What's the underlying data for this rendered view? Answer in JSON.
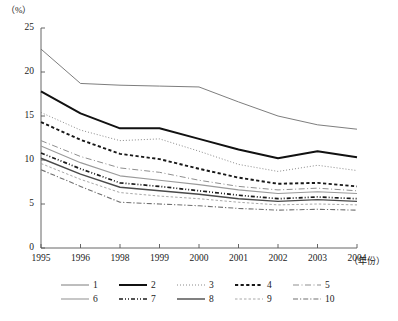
{
  "chart_data": {
    "type": "line",
    "title": "",
    "xlabel": "（年份）",
    "ylabel": "（%）",
    "x": [
      "1995",
      "1996",
      "1998",
      "1999",
      "2000",
      "2001",
      "2002",
      "2003",
      "2004"
    ],
    "categories": [
      "1995",
      "1996",
      "1998",
      "1999",
      "2000",
      "2001",
      "2002",
      "2003",
      "2004"
    ],
    "ylim": [
      0,
      25
    ],
    "yticks": [
      "0",
      "5",
      "10",
      "15",
      "20",
      "25"
    ],
    "grid": false,
    "legend_position": "bottom",
    "series": [
      {
        "name": "1",
        "label": "1",
        "style": "solid-thin",
        "values": [
          22.6,
          18.7,
          18.5,
          18.4,
          18.3,
          16.6,
          15.0,
          14.0,
          13.5
        ]
      },
      {
        "name": "2",
        "label": "2",
        "style": "solid-thick",
        "values": [
          17.8,
          15.3,
          13.6,
          13.6,
          12.4,
          11.2,
          10.2,
          11.0,
          10.3
        ]
      },
      {
        "name": "3",
        "label": "3",
        "style": "dotted",
        "values": [
          15.4,
          13.4,
          12.2,
          12.4,
          11.0,
          9.5,
          8.7,
          9.4,
          8.8
        ]
      },
      {
        "name": "4",
        "label": "4",
        "style": "dashed-thick",
        "values": [
          14.3,
          12.3,
          10.7,
          10.1,
          9.0,
          8.0,
          7.3,
          7.4,
          7.0
        ]
      },
      {
        "name": "5",
        "label": "5",
        "style": "dashdot-long",
        "values": [
          12.2,
          10.4,
          9.1,
          8.6,
          7.7,
          7.0,
          6.6,
          6.8,
          6.5
        ]
      },
      {
        "name": "6",
        "label": "6",
        "style": "solid-medium",
        "values": [
          11.6,
          9.7,
          8.2,
          7.7,
          7.2,
          6.6,
          6.2,
          6.4,
          6.2
        ]
      },
      {
        "name": "7",
        "label": "7",
        "style": "dashdotdot",
        "values": [
          10.8,
          9.0,
          7.4,
          7.0,
          6.5,
          6.0,
          5.6,
          5.8,
          5.6
        ]
      },
      {
        "name": "8",
        "label": "8",
        "style": "solid-dark",
        "values": [
          10.2,
          8.4,
          6.9,
          6.5,
          6.1,
          5.6,
          5.3,
          5.5,
          5.3
        ]
      },
      {
        "name": "9",
        "label": "9",
        "style": "dashed-fine",
        "values": [
          9.6,
          7.8,
          6.3,
          5.9,
          5.6,
          5.2,
          4.9,
          5.0,
          4.9
        ]
      },
      {
        "name": "10",
        "label": "10",
        "style": "dashdot-fine",
        "values": [
          8.9,
          7.0,
          5.2,
          5.0,
          4.8,
          4.5,
          4.3,
          4.4,
          4.3
        ]
      }
    ]
  },
  "legend": {
    "row1": [
      "1",
      "2",
      "3",
      "4",
      "5"
    ],
    "row2": [
      "6",
      "7",
      "8",
      "9",
      "10"
    ]
  }
}
